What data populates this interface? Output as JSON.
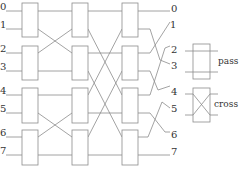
{
  "diagram": {
    "title": "",
    "input_labels": [
      "0",
      "1",
      "2",
      "3",
      "4",
      "5",
      "6",
      "7"
    ],
    "output_labels": [
      "0",
      "1",
      "2",
      "3",
      "4",
      "5",
      "6",
      "7"
    ],
    "stages": 3,
    "switches_per_stage": 4,
    "legend": {
      "pass_label": "pass",
      "cross_label": "cross"
    },
    "colors": {
      "line": "#8c8c8c",
      "text": "#333333",
      "background": "#ffffff"
    }
  }
}
